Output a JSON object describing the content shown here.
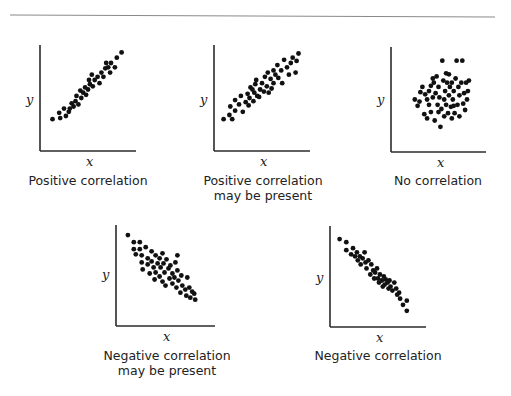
{
  "figure": {
    "panels": [
      {
        "id": "positive",
        "caption_lines": [
          "Positive correlation"
        ],
        "x_label": "x",
        "y_label": "y"
      },
      {
        "id": "positive-maybe",
        "caption_lines": [
          "Positive correlation",
          "may be present"
        ],
        "x_label": "x",
        "y_label": "y"
      },
      {
        "id": "none",
        "caption_lines": [
          "No correlation"
        ],
        "x_label": "x",
        "y_label": "y"
      },
      {
        "id": "negative-maybe",
        "caption_lines": [
          "Negative correlation",
          "may be present"
        ],
        "x_label": "x",
        "y_label": "y"
      },
      {
        "id": "negative",
        "caption_lines": [
          "Negative correlation"
        ],
        "x_label": "x",
        "y_label": "y"
      }
    ]
  },
  "colors": {
    "axis": "#2b2b2b",
    "dot": "#111111",
    "rule": "#8a8a8a",
    "text": "#222222"
  },
  "chart_data": [
    {
      "type": "scatter",
      "title": "Positive correlation",
      "xlabel": "x",
      "ylabel": "y",
      "grid": false,
      "ticks": false,
      "xlim": [
        0,
        100
      ],
      "ylim": [
        0,
        100
      ],
      "points": [
        [
          13,
          30
        ],
        [
          20,
          36
        ],
        [
          21,
          31
        ],
        [
          27,
          33
        ],
        [
          25,
          40
        ],
        [
          30,
          37
        ],
        [
          33,
          45
        ],
        [
          31,
          40
        ],
        [
          35,
          42
        ],
        [
          37,
          47
        ],
        [
          40,
          44
        ],
        [
          38,
          52
        ],
        [
          43,
          50
        ],
        [
          45,
          55
        ],
        [
          42,
          57
        ],
        [
          48,
          53
        ],
        [
          47,
          60
        ],
        [
          50,
          58
        ],
        [
          52,
          63
        ],
        [
          51,
          67
        ],
        [
          55,
          61
        ],
        [
          57,
          67
        ],
        [
          54,
          72
        ],
        [
          60,
          70
        ],
        [
          62,
          64
        ],
        [
          64,
          74
        ],
        [
          66,
          70
        ],
        [
          68,
          78
        ],
        [
          69,
          83
        ],
        [
          71,
          79
        ],
        [
          74,
          83
        ],
        [
          73,
          74
        ],
        [
          78,
          79
        ],
        [
          80,
          88
        ],
        [
          85,
          93
        ]
      ]
    },
    {
      "type": "scatter",
      "title": "Positive correlation may be present",
      "xlabel": "x",
      "ylabel": "y",
      "grid": false,
      "ticks": false,
      "xlim": [
        0,
        100
      ],
      "ylim": [
        0,
        100
      ],
      "points": [
        [
          10,
          30
        ],
        [
          16,
          34
        ],
        [
          19,
          30
        ],
        [
          17,
          42
        ],
        [
          22,
          38
        ],
        [
          22,
          48
        ],
        [
          26,
          44
        ],
        [
          28,
          52
        ],
        [
          30,
          37
        ],
        [
          33,
          46
        ],
        [
          36,
          43
        ],
        [
          35,
          54
        ],
        [
          38,
          60
        ],
        [
          37,
          50
        ],
        [
          41,
          47
        ],
        [
          42,
          55
        ],
        [
          45,
          52
        ],
        [
          43,
          63
        ],
        [
          44,
          67
        ],
        [
          48,
          58
        ],
        [
          47,
          51
        ],
        [
          50,
          64
        ],
        [
          52,
          56
        ],
        [
          53,
          70
        ],
        [
          55,
          61
        ],
        [
          56,
          74
        ],
        [
          59,
          68
        ],
        [
          60,
          59
        ],
        [
          62,
          64
        ],
        [
          62,
          76
        ],
        [
          64,
          72
        ],
        [
          66,
          81
        ],
        [
          67,
          69
        ],
        [
          70,
          76
        ],
        [
          71,
          64
        ],
        [
          73,
          86
        ],
        [
          76,
          79
        ],
        [
          78,
          72
        ],
        [
          80,
          83
        ],
        [
          82,
          88
        ],
        [
          86,
          85
        ],
        [
          85,
          74
        ],
        [
          88,
          92
        ],
        [
          57,
          55
        ],
        [
          40,
          58
        ]
      ]
    },
    {
      "type": "scatter",
      "title": "No correlation",
      "xlabel": "x",
      "ylabel": "y",
      "grid": false,
      "ticks": false,
      "xlim": [
        0,
        100
      ],
      "ylim": [
        0,
        100
      ],
      "points": [
        [
          25,
          50
        ],
        [
          28,
          44
        ],
        [
          30,
          48
        ],
        [
          31,
          57
        ],
        [
          33,
          62
        ],
        [
          35,
          36
        ],
        [
          38,
          32
        ],
        [
          38,
          50
        ],
        [
          40,
          45
        ],
        [
          40,
          58
        ],
        [
          42,
          63
        ],
        [
          42,
          38
        ],
        [
          44,
          52
        ],
        [
          45,
          66
        ],
        [
          46,
          30
        ],
        [
          47,
          56
        ],
        [
          48,
          72
        ],
        [
          49,
          45
        ],
        [
          50,
          38
        ],
        [
          50,
          62
        ],
        [
          51,
          52
        ],
        [
          52,
          24
        ],
        [
          53,
          41
        ],
        [
          54,
          87
        ],
        [
          55,
          68
        ],
        [
          56,
          50
        ],
        [
          56,
          34
        ],
        [
          57,
          58
        ],
        [
          58,
          45
        ],
        [
          59,
          66
        ],
        [
          60,
          37
        ],
        [
          61,
          74
        ],
        [
          61,
          54
        ],
        [
          62,
          62
        ],
        [
          63,
          43
        ],
        [
          64,
          32
        ],
        [
          64,
          66
        ],
        [
          65,
          50
        ],
        [
          66,
          58
        ],
        [
          67,
          37
        ],
        [
          68,
          70
        ],
        [
          69,
          87
        ],
        [
          70,
          45
        ],
        [
          71,
          62
        ],
        [
          72,
          54
        ],
        [
          72,
          34
        ],
        [
          74,
          66
        ],
        [
          75,
          87
        ],
        [
          76,
          46
        ],
        [
          77,
          56
        ],
        [
          78,
          40
        ],
        [
          79,
          66
        ],
        [
          80,
          50
        ],
        [
          81,
          58
        ],
        [
          82,
          68
        ],
        [
          36,
          55
        ],
        [
          44,
          70
        ],
        [
          58,
          75
        ],
        [
          66,
          44
        ]
      ]
    },
    {
      "type": "scatter",
      "title": "Negative correlation may be present",
      "xlabel": "x",
      "ylabel": "y",
      "grid": false,
      "ticks": false,
      "xlim": [
        0,
        100
      ],
      "ylim": [
        0,
        100
      ],
      "points": [
        [
          12,
          90
        ],
        [
          18,
          83
        ],
        [
          18,
          76
        ],
        [
          20,
          71
        ],
        [
          24,
          83
        ],
        [
          24,
          76
        ],
        [
          26,
          70
        ],
        [
          26,
          63
        ],
        [
          27,
          56
        ],
        [
          30,
          78
        ],
        [
          32,
          67
        ],
        [
          32,
          61
        ],
        [
          34,
          52
        ],
        [
          36,
          74
        ],
        [
          36,
          64
        ],
        [
          38,
          58
        ],
        [
          39,
          46
        ],
        [
          40,
          70
        ],
        [
          40,
          53
        ],
        [
          42,
          62
        ],
        [
          44,
          67
        ],
        [
          44,
          49
        ],
        [
          45,
          58
        ],
        [
          47,
          72
        ],
        [
          47,
          44
        ],
        [
          48,
          62
        ],
        [
          49,
          53
        ],
        [
          50,
          40
        ],
        [
          51,
          66
        ],
        [
          53,
          57
        ],
        [
          54,
          47
        ],
        [
          55,
          60
        ],
        [
          57,
          42
        ],
        [
          57,
          52
        ],
        [
          59,
          48
        ],
        [
          60,
          63
        ],
        [
          61,
          38
        ],
        [
          62,
          55
        ],
        [
          63,
          45
        ],
        [
          65,
          33
        ],
        [
          66,
          50
        ],
        [
          67,
          40
        ],
        [
          70,
          36
        ],
        [
          71,
          30
        ],
        [
          72,
          48
        ],
        [
          74,
          38
        ],
        [
          75,
          28
        ],
        [
          77,
          34
        ],
        [
          79,
          32
        ],
        [
          80,
          26
        ],
        [
          62,
          70
        ]
      ]
    },
    {
      "type": "scatter",
      "title": "Negative correlation",
      "xlabel": "x",
      "ylabel": "y",
      "grid": false,
      "ticks": false,
      "xlim": [
        0,
        100
      ],
      "ylim": [
        0,
        100
      ],
      "points": [
        [
          10,
          87
        ],
        [
          17,
          84
        ],
        [
          17,
          76
        ],
        [
          22,
          72
        ],
        [
          24,
          78
        ],
        [
          26,
          70
        ],
        [
          28,
          74
        ],
        [
          29,
          66
        ],
        [
          31,
          70
        ],
        [
          32,
          62
        ],
        [
          34,
          68
        ],
        [
          36,
          74
        ],
        [
          37,
          64
        ],
        [
          38,
          58
        ],
        [
          40,
          66
        ],
        [
          42,
          52
        ],
        [
          43,
          62
        ],
        [
          45,
          56
        ],
        [
          47,
          54
        ],
        [
          49,
          58
        ],
        [
          50,
          48
        ],
        [
          51,
          44
        ],
        [
          52,
          52
        ],
        [
          54,
          46
        ],
        [
          56,
          50
        ],
        [
          57,
          42
        ],
        [
          58,
          47
        ],
        [
          60,
          44
        ],
        [
          61,
          38
        ],
        [
          62,
          46
        ],
        [
          63,
          40
        ],
        [
          65,
          36
        ],
        [
          67,
          44
        ],
        [
          69,
          38
        ],
        [
          70,
          32
        ],
        [
          72,
          34
        ],
        [
          73,
          28
        ],
        [
          76,
          22
        ],
        [
          80,
          26
        ],
        [
          80,
          16
        ],
        [
          46,
          48
        ],
        [
          55,
          40
        ]
      ]
    }
  ]
}
